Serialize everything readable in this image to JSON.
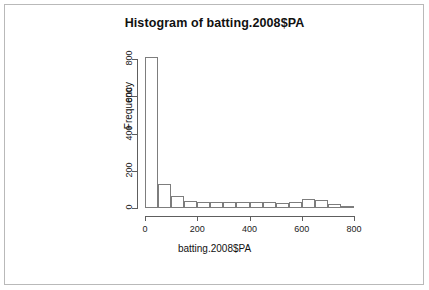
{
  "chart_data": {
    "type": "bar",
    "title": "Histogram of batting.2008$PA",
    "xlabel": "batting.2008$PA",
    "ylabel": "Frequency",
    "grid": false,
    "legend": null,
    "binwidth": 50,
    "xlim": [
      0,
      800
    ],
    "ylim": [
      0,
      800
    ],
    "xticks": [
      0,
      200,
      400,
      600,
      800
    ],
    "yticks": [
      0,
      200,
      400,
      600,
      800
    ],
    "bin_starts": [
      0,
      50,
      100,
      150,
      200,
      250,
      300,
      350,
      400,
      450,
      500,
      550,
      600,
      650,
      700,
      750
    ],
    "bin_ends": [
      50,
      100,
      150,
      200,
      250,
      300,
      350,
      400,
      450,
      500,
      550,
      600,
      650,
      700,
      750,
      800
    ],
    "categories": [
      "0-50",
      "50-100",
      "100-150",
      "150-200",
      "200-250",
      "250-300",
      "300-350",
      "350-400",
      "400-450",
      "450-500",
      "500-550",
      "550-600",
      "600-650",
      "650-700",
      "700-750",
      "750-800"
    ],
    "values": [
      810,
      129,
      64,
      38,
      32,
      30,
      33,
      33,
      31,
      30,
      27,
      34,
      48,
      43,
      20,
      6
    ]
  },
  "axes": {
    "y_tick_labels": [
      "0",
      "200",
      "400",
      "600",
      "800"
    ],
    "x_tick_labels": [
      "0",
      "200",
      "400",
      "600",
      "800"
    ]
  }
}
